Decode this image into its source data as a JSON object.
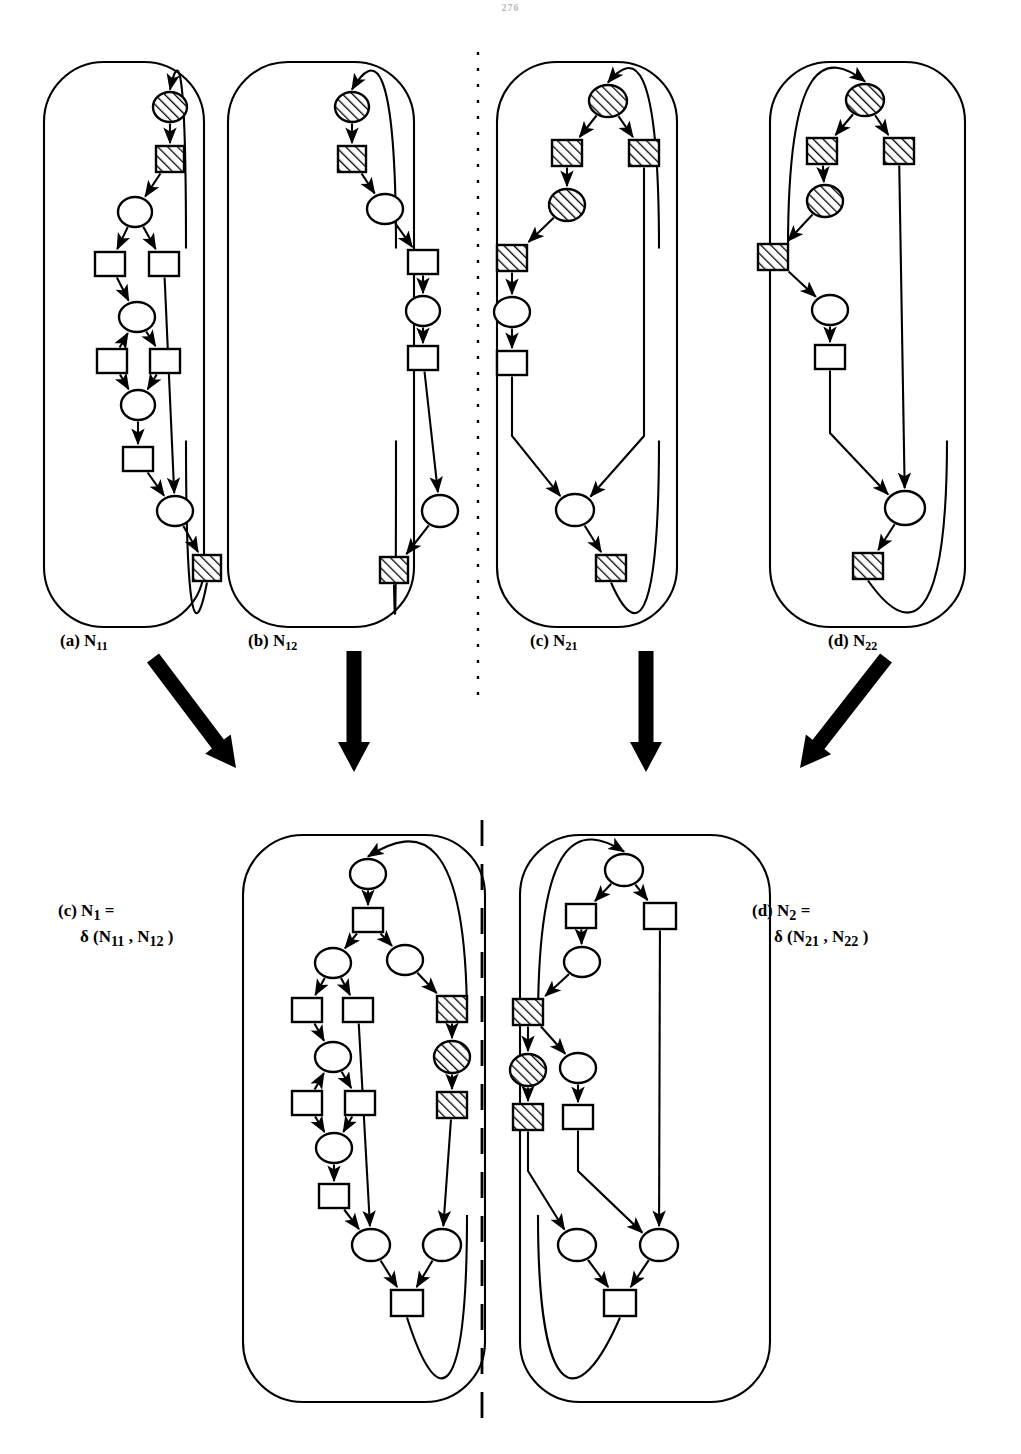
{
  "page": {
    "header_text": "276",
    "bg": "#ffffff",
    "ink": "#000000"
  },
  "figure": {
    "title": "",
    "divider": {
      "name": "vertical-dashed-divider",
      "x": 478,
      "style": "dashed"
    },
    "top_row_labels": [
      {
        "id": "a",
        "prefix": "(a)",
        "base": "N",
        "sub": "11",
        "x": 60,
        "y": 631
      },
      {
        "id": "b",
        "prefix": "(b)",
        "base": "N",
        "sub": "12",
        "x": 248,
        "y": 631
      },
      {
        "id": "c",
        "prefix": "(c)",
        "base": "N",
        "sub": "21",
        "x": 530,
        "y": 631
      },
      {
        "id": "d",
        "prefix": "(d)",
        "base": "N",
        "sub": "22",
        "x": 828,
        "y": 631
      }
    ],
    "bottom_row_labels": [
      {
        "id": "c2",
        "prefix": "(c)",
        "base": "N",
        "sub": "1",
        "equals": "=",
        "op": "δ",
        "args": "(N11 , N12 )",
        "line1": "(c) N1 =",
        "line2": "δ (N11 , N12 )",
        "x": 58,
        "y": 900
      },
      {
        "id": "d2",
        "prefix": "(d)",
        "base": "N",
        "sub": "2",
        "equals": "=",
        "op": "δ",
        "args": "(N21 , N22 )",
        "line1": "(d) N2 =",
        "line2": "δ (N21 , N22 )",
        "x": 752,
        "y": 900
      }
    ],
    "transform_arrows": [
      {
        "name": "transform-arrow-a",
        "kind": "diagonal-down-right",
        "x1": 153,
        "y1": 658,
        "x2": 236,
        "y2": 768
      },
      {
        "name": "transform-arrow-b",
        "kind": "vertical-down",
        "x1": 354,
        "y1": 651,
        "x2": 354,
        "y2": 772
      },
      {
        "name": "transform-arrow-c",
        "kind": "vertical-down",
        "x1": 646,
        "y1": 651,
        "x2": 646,
        "y2": 772
      },
      {
        "name": "transform-arrow-d",
        "kind": "diagonal-down-left",
        "x1": 886,
        "y1": 658,
        "x2": 800,
        "y2": 768
      }
    ],
    "node_legend": {
      "circle_plain": "place-node",
      "circle_hatched": "place-node-marked",
      "square_plain": "transition-node",
      "square_hatched": "transition-node-marked"
    }
  },
  "nets": [
    {
      "id": "N11",
      "name": "net-n11",
      "frame": {
        "x": 44,
        "y": 62,
        "w": 160,
        "h": 565,
        "r": 60
      },
      "nodes": [
        {
          "id": "p1",
          "type": "circle-hatched",
          "x": 170,
          "y": 107,
          "rx": 17,
          "ry": 15
        },
        {
          "id": "t1",
          "type": "square-hatched",
          "x": 170,
          "y": 159,
          "w": 28,
          "h": 26
        },
        {
          "id": "p2",
          "type": "circle",
          "x": 135,
          "y": 212,
          "rx": 17,
          "ry": 15
        },
        {
          "id": "t2",
          "type": "square",
          "x": 110,
          "y": 264,
          "w": 30,
          "h": 24
        },
        {
          "id": "t3",
          "type": "square",
          "x": 164,
          "y": 264,
          "w": 30,
          "h": 24
        },
        {
          "id": "p3",
          "type": "circle",
          "x": 137,
          "y": 317,
          "rx": 18,
          "ry": 15
        },
        {
          "id": "t4",
          "type": "square",
          "x": 112,
          "y": 361,
          "w": 30,
          "h": 24
        },
        {
          "id": "t5",
          "type": "square",
          "x": 165,
          "y": 361,
          "w": 30,
          "h": 24
        },
        {
          "id": "p4",
          "type": "circle",
          "x": 138,
          "y": 405,
          "rx": 17,
          "ry": 15
        },
        {
          "id": "t6",
          "type": "square",
          "x": 138,
          "y": 459,
          "w": 30,
          "h": 24
        },
        {
          "id": "p5",
          "type": "circle",
          "x": 175,
          "y": 511,
          "rx": 18,
          "ry": 15
        },
        {
          "id": "t7",
          "type": "square-hatched",
          "x": 207,
          "y": 568,
          "w": 28,
          "h": 26
        }
      ],
      "edges": [
        {
          "from": "frame-top",
          "to": "p1"
        },
        {
          "from": "p1",
          "to": "t1"
        },
        {
          "from": "t1",
          "to": "p2"
        },
        {
          "from": "p2",
          "to": "t2"
        },
        {
          "from": "p2",
          "to": "t3"
        },
        {
          "from": "t2",
          "to": "p3"
        },
        {
          "from": "t4",
          "to": "p3"
        },
        {
          "from": "p3",
          "to": "t5"
        },
        {
          "from": "t4",
          "to": "p4"
        },
        {
          "from": "t5",
          "to": "p4"
        },
        {
          "from": "p4",
          "to": "t6"
        },
        {
          "from": "t6",
          "to": "p5"
        },
        {
          "from": "t3",
          "to": "p5"
        },
        {
          "from": "p5",
          "to": "t7"
        },
        {
          "from": "t7",
          "to": "frame-bottom"
        }
      ]
    },
    {
      "id": "N12",
      "name": "net-n12",
      "frame": {
        "x": 228,
        "y": 62,
        "w": 186,
        "h": 565,
        "r": 60
      },
      "nodes": [
        {
          "id": "p1",
          "type": "circle-hatched",
          "x": 352,
          "y": 107,
          "rx": 17,
          "ry": 15
        },
        {
          "id": "t1",
          "type": "square-hatched",
          "x": 352,
          "y": 159,
          "w": 28,
          "h": 26
        },
        {
          "id": "p2",
          "type": "circle",
          "x": 385,
          "y": 209,
          "rx": 18,
          "ry": 15
        },
        {
          "id": "t2",
          "type": "square",
          "x": 423,
          "y": 262,
          "w": 30,
          "h": 24
        },
        {
          "id": "p3",
          "type": "circle",
          "x": 423,
          "y": 311,
          "rx": 17,
          "ry": 15
        },
        {
          "id": "t3",
          "type": "square",
          "x": 423,
          "y": 358,
          "w": 30,
          "h": 24
        },
        {
          "id": "p4",
          "type": "circle",
          "x": 440,
          "y": 511,
          "rx": 18,
          "ry": 16
        },
        {
          "id": "t4",
          "type": "square-hatched",
          "x": 394,
          "y": 570,
          "w": 28,
          "h": 26
        }
      ],
      "edges": [
        {
          "from": "frame-top",
          "to": "p1"
        },
        {
          "from": "p1",
          "to": "t1"
        },
        {
          "from": "t1",
          "to": "p2"
        },
        {
          "from": "p2",
          "to": "t2"
        },
        {
          "from": "t2",
          "to": "p3"
        },
        {
          "from": "p3",
          "to": "t3"
        },
        {
          "from": "t3",
          "to": "p4"
        },
        {
          "from": "p4",
          "to": "t4"
        },
        {
          "from": "t4",
          "to": "frame-bottom"
        }
      ]
    },
    {
      "id": "N21",
      "name": "net-n21",
      "frame": {
        "x": 497,
        "y": 62,
        "w": 180,
        "h": 565,
        "r": 60
      },
      "nodes": [
        {
          "id": "p1",
          "type": "circle-hatched",
          "x": 608,
          "y": 101,
          "rx": 19,
          "ry": 16
        },
        {
          "id": "t1",
          "type": "square-hatched",
          "x": 567,
          "y": 153,
          "w": 30,
          "h": 26
        },
        {
          "id": "t2",
          "type": "square-hatched",
          "x": 644,
          "y": 153,
          "w": 30,
          "h": 26
        },
        {
          "id": "p2",
          "type": "circle-hatched",
          "x": 567,
          "y": 205,
          "rx": 18,
          "ry": 16
        },
        {
          "id": "t3",
          "type": "square-hatched",
          "x": 512,
          "y": 258,
          "w": 30,
          "h": 26
        },
        {
          "id": "p3",
          "type": "circle",
          "x": 512,
          "y": 312,
          "rx": 18,
          "ry": 15
        },
        {
          "id": "t4",
          "type": "square",
          "x": 512,
          "y": 363,
          "w": 30,
          "h": 24
        },
        {
          "id": "p4",
          "type": "circle",
          "x": 575,
          "y": 510,
          "rx": 19,
          "ry": 16
        },
        {
          "id": "t5",
          "type": "square-hatched",
          "x": 611,
          "y": 568,
          "w": 30,
          "h": 26
        }
      ],
      "edges": [
        {
          "from": "frame-top",
          "to": "p1"
        },
        {
          "from": "p1",
          "to": "t1"
        },
        {
          "from": "p1",
          "to": "t2"
        },
        {
          "from": "t1",
          "to": "p2"
        },
        {
          "from": "p2",
          "to": "t3"
        },
        {
          "from": "t3",
          "to": "p3"
        },
        {
          "from": "p3",
          "to": "t4"
        },
        {
          "from": "t4",
          "to": "p4"
        },
        {
          "from": "t2",
          "to": "p4"
        },
        {
          "from": "p4",
          "to": "t5"
        },
        {
          "from": "t5",
          "to": "frame-bottom"
        }
      ]
    },
    {
      "id": "N22",
      "name": "net-n22",
      "frame": {
        "x": 770,
        "y": 62,
        "w": 195,
        "h": 565,
        "r": 60
      },
      "nodes": [
        {
          "id": "p1",
          "type": "circle-hatched",
          "x": 865,
          "y": 100,
          "rx": 19,
          "ry": 16
        },
        {
          "id": "t1",
          "type": "square-hatched",
          "x": 822,
          "y": 151,
          "w": 30,
          "h": 26
        },
        {
          "id": "t2",
          "type": "square-hatched",
          "x": 899,
          "y": 151,
          "w": 30,
          "h": 26
        },
        {
          "id": "p2",
          "type": "circle-hatched",
          "x": 825,
          "y": 201,
          "rx": 18,
          "ry": 16
        },
        {
          "id": "t3",
          "type": "square-hatched",
          "x": 773,
          "y": 257,
          "w": 30,
          "h": 26
        },
        {
          "id": "p3",
          "type": "circle",
          "x": 830,
          "y": 310,
          "rx": 18,
          "ry": 15
        },
        {
          "id": "t4",
          "type": "square",
          "x": 830,
          "y": 357,
          "w": 30,
          "h": 24
        },
        {
          "id": "p4",
          "type": "circle",
          "x": 905,
          "y": 508,
          "rx": 20,
          "ry": 17
        },
        {
          "id": "t5",
          "type": "square-hatched",
          "x": 868,
          "y": 566,
          "w": 30,
          "h": 26
        }
      ],
      "edges": [
        {
          "from": "frame-top",
          "to": "p1"
        },
        {
          "from": "p1",
          "to": "t1"
        },
        {
          "from": "p1",
          "to": "t2"
        },
        {
          "from": "t1",
          "to": "p2"
        },
        {
          "from": "p2",
          "to": "t3"
        },
        {
          "from": "t3",
          "to": "p3"
        },
        {
          "from": "p3",
          "to": "t4"
        },
        {
          "from": "t4",
          "to": "p4"
        },
        {
          "from": "t2",
          "to": "p4"
        },
        {
          "from": "p4",
          "to": "t5"
        },
        {
          "from": "t5",
          "to": "frame-bottom"
        }
      ]
    },
    {
      "id": "N1",
      "name": "net-n1-composed",
      "frame": {
        "x": 243,
        "y": 835,
        "w": 242,
        "h": 567,
        "r": 60
      },
      "nodes": [
        {
          "id": "p1",
          "type": "circle",
          "x": 368,
          "y": 874,
          "rx": 18,
          "ry": 15
        },
        {
          "id": "t1",
          "type": "square",
          "x": 368,
          "y": 920,
          "w": 30,
          "h": 24
        },
        {
          "id": "p2",
          "type": "circle",
          "x": 333,
          "y": 963,
          "rx": 18,
          "ry": 15
        },
        {
          "id": "p2b",
          "type": "circle",
          "x": 405,
          "y": 960,
          "rx": 18,
          "ry": 15
        },
        {
          "id": "t2",
          "type": "square",
          "x": 307,
          "y": 1010,
          "w": 30,
          "h": 24
        },
        {
          "id": "t3",
          "type": "square",
          "x": 358,
          "y": 1010,
          "w": 30,
          "h": 24
        },
        {
          "id": "tx",
          "type": "square-hatched",
          "x": 452,
          "y": 1009,
          "w": 30,
          "h": 26
        },
        {
          "id": "p3",
          "type": "circle",
          "x": 333,
          "y": 1057,
          "rx": 18,
          "ry": 15
        },
        {
          "id": "px",
          "type": "circle-hatched",
          "x": 452,
          "y": 1057,
          "rx": 18,
          "ry": 16
        },
        {
          "id": "t4",
          "type": "square",
          "x": 307,
          "y": 1103,
          "w": 30,
          "h": 24
        },
        {
          "id": "t5",
          "type": "square",
          "x": 360,
          "y": 1103,
          "w": 30,
          "h": 24
        },
        {
          "id": "ty",
          "type": "square-hatched",
          "x": 452,
          "y": 1105,
          "w": 30,
          "h": 26
        },
        {
          "id": "p4",
          "type": "circle",
          "x": 334,
          "y": 1148,
          "rx": 18,
          "ry": 15
        },
        {
          "id": "t6",
          "type": "square",
          "x": 334,
          "y": 1196,
          "w": 30,
          "h": 24
        },
        {
          "id": "p5",
          "type": "circle",
          "x": 371,
          "y": 1245,
          "rx": 19,
          "ry": 16
        },
        {
          "id": "p6",
          "type": "circle",
          "x": 442,
          "y": 1245,
          "rx": 19,
          "ry": 16
        },
        {
          "id": "t7",
          "type": "square",
          "x": 407,
          "y": 1303,
          "w": 32,
          "h": 26
        }
      ],
      "edges": [
        {
          "from": "frame-top",
          "to": "p1"
        },
        {
          "from": "p1",
          "to": "t1"
        },
        {
          "from": "t1",
          "to": "p2"
        },
        {
          "from": "t1",
          "to": "p2b"
        },
        {
          "from": "p2",
          "to": "t2"
        },
        {
          "from": "p2",
          "to": "t3"
        },
        {
          "from": "p2b",
          "to": "tx"
        },
        {
          "from": "tx",
          "to": "px"
        },
        {
          "from": "px",
          "to": "ty"
        },
        {
          "from": "ty",
          "to": "p6"
        },
        {
          "from": "t2",
          "to": "p3"
        },
        {
          "from": "t4",
          "to": "p3"
        },
        {
          "from": "p3",
          "to": "t5"
        },
        {
          "from": "t4",
          "to": "p4"
        },
        {
          "from": "t5",
          "to": "p4"
        },
        {
          "from": "p4",
          "to": "t6"
        },
        {
          "from": "t6",
          "to": "p5"
        },
        {
          "from": "t3",
          "to": "p5"
        },
        {
          "from": "p5",
          "to": "t7"
        },
        {
          "from": "p6",
          "to": "t7"
        },
        {
          "from": "t7",
          "to": "frame-bottom"
        }
      ]
    },
    {
      "id": "N2",
      "name": "net-n2-composed",
      "frame": {
        "x": 520,
        "y": 835,
        "w": 250,
        "h": 567,
        "r": 60
      },
      "nodes": [
        {
          "id": "p1",
          "type": "circle",
          "x": 624,
          "y": 870,
          "rx": 19,
          "ry": 16
        },
        {
          "id": "t1",
          "type": "square",
          "x": 581,
          "y": 916,
          "w": 30,
          "h": 24
        },
        {
          "id": "t2",
          "type": "square",
          "x": 660,
          "y": 916,
          "w": 32,
          "h": 26
        },
        {
          "id": "p2",
          "type": "circle",
          "x": 582,
          "y": 962,
          "rx": 18,
          "ry": 15
        },
        {
          "id": "t3",
          "type": "square-hatched",
          "x": 528,
          "y": 1012,
          "w": 30,
          "h": 26
        },
        {
          "id": "p3",
          "type": "circle-hatched",
          "x": 528,
          "y": 1070,
          "rx": 18,
          "ry": 16
        },
        {
          "id": "p3b",
          "type": "circle",
          "x": 578,
          "y": 1068,
          "rx": 18,
          "ry": 15
        },
        {
          "id": "t4",
          "type": "square-hatched",
          "x": 528,
          "y": 1117,
          "w": 30,
          "h": 26
        },
        {
          "id": "t4b",
          "type": "square",
          "x": 578,
          "y": 1117,
          "w": 30,
          "h": 24
        },
        {
          "id": "p4",
          "type": "circle",
          "x": 577,
          "y": 1245,
          "rx": 19,
          "ry": 16
        },
        {
          "id": "p5",
          "type": "circle",
          "x": 659,
          "y": 1245,
          "rx": 19,
          "ry": 16
        },
        {
          "id": "t5",
          "type": "square",
          "x": 620,
          "y": 1303,
          "w": 32,
          "h": 26
        }
      ],
      "edges": [
        {
          "from": "frame-top",
          "to": "p1"
        },
        {
          "from": "p1",
          "to": "t1"
        },
        {
          "from": "p1",
          "to": "t2"
        },
        {
          "from": "t1",
          "to": "p2"
        },
        {
          "from": "p2",
          "to": "t3"
        },
        {
          "from": "t3",
          "to": "p3"
        },
        {
          "from": "t3",
          "to": "p3b"
        },
        {
          "from": "p3",
          "to": "t4"
        },
        {
          "from": "p3b",
          "to": "t4b"
        },
        {
          "from": "t4",
          "to": "p4",
          "crossing": true
        },
        {
          "from": "t4b",
          "to": "p5",
          "crossing": true
        },
        {
          "from": "t2",
          "to": "p5"
        },
        {
          "from": "p4",
          "to": "t5"
        },
        {
          "from": "p5",
          "to": "t5"
        },
        {
          "from": "t5",
          "to": "frame-bottom"
        }
      ]
    }
  ]
}
